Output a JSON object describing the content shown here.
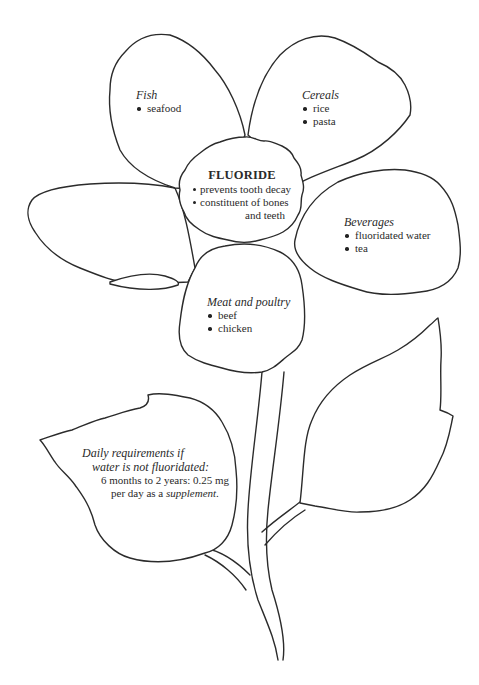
{
  "diagram": {
    "type": "flower-infographic",
    "center": {
      "title": "FLUORIDE",
      "bullets": [
        "prevents tooth decay",
        "constituent of bones"
      ],
      "continuation": "and teeth"
    },
    "petals": [
      {
        "id": "fish",
        "title": "Fish",
        "items": [
          "seafood"
        ]
      },
      {
        "id": "cereals",
        "title": "Cereals",
        "items": [
          "rice",
          "pasta"
        ]
      },
      {
        "id": "beverages",
        "title": "Beverages",
        "items": [
          "fluoridated water",
          "tea"
        ]
      },
      {
        "id": "meat",
        "title": "Meat and poultry",
        "items": [
          "beef",
          "chicken"
        ]
      },
      {
        "id": "left-blank",
        "title": "",
        "items": []
      }
    ],
    "leaf_note": {
      "line1": "Daily requirements if",
      "line2": "water is not fluoridated:",
      "line3": "6 months to 2 years: 0.25 mg",
      "line4_prefix": "per day as a ",
      "line4_emphasis": "supplement",
      "line4_suffix": "."
    },
    "colors": {
      "stroke": "#2b2b2b",
      "fill": "#ffffff",
      "text": "#2a2a2a"
    }
  }
}
